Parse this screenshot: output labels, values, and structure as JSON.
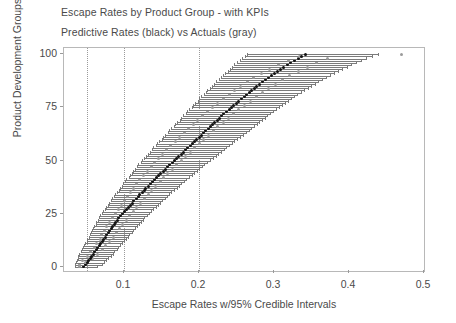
{
  "chart_data": {
    "type": "scatter",
    "title": "Escape Rates by Product Group - with KPIs",
    "subtitle": "Predictive Rates (black) vs Actuals (gray)",
    "xlabel": "Escape Rates w/95% Credible Intervals",
    "ylabel": "Product Development Groups",
    "xlim": [
      0.02,
      0.5
    ],
    "ylim": [
      -2,
      103
    ],
    "xticks": [
      0.1,
      0.2,
      0.3,
      0.4,
      0.5
    ],
    "xtick_labels": [
      "0.1",
      "0.2",
      "0.3",
      "0.4",
      "0.5"
    ],
    "yticks": [
      0,
      25,
      50,
      75,
      100
    ],
    "ytick_labels": [
      "0",
      "25",
      "50",
      "75",
      "100"
    ],
    "grid": false,
    "reference_lines": [
      0.05,
      0.1,
      0.2
    ],
    "legend": "none",
    "series": [
      {
        "name": "Predictive Rates (black)",
        "color": "#101010",
        "marker": "point"
      },
      {
        "name": "Actuals (gray)",
        "color": "#9b9b9b",
        "marker": "point"
      },
      {
        "name": "95% Credible Intervals",
        "color": "#7b7b7b",
        "marker": "hline"
      }
    ],
    "groups": [
      {
        "y": 0,
        "pred": 0.046,
        "lo": 0.034,
        "hi": 0.064,
        "actual": 0.04
      },
      {
        "y": 1,
        "pred": 0.049,
        "lo": 0.035,
        "hi": 0.07,
        "actual": 0.041
      },
      {
        "y": 2,
        "pred": 0.051,
        "lo": 0.036,
        "hi": 0.073,
        "actual": 0.049
      },
      {
        "y": 3,
        "pred": 0.053,
        "lo": 0.037,
        "hi": 0.076,
        "actual": 0.044
      },
      {
        "y": 4,
        "pred": 0.055,
        "lo": 0.038,
        "hi": 0.079,
        "actual": 0.058
      },
      {
        "y": 5,
        "pred": 0.057,
        "lo": 0.039,
        "hi": 0.082,
        "actual": 0.051
      },
      {
        "y": 6,
        "pred": 0.059,
        "lo": 0.04,
        "hi": 0.085,
        "actual": 0.064
      },
      {
        "y": 7,
        "pred": 0.061,
        "lo": 0.042,
        "hi": 0.087,
        "actual": 0.055
      },
      {
        "y": 8,
        "pred": 0.063,
        "lo": 0.044,
        "hi": 0.09,
        "actual": 0.071
      },
      {
        "y": 9,
        "pred": 0.065,
        "lo": 0.045,
        "hi": 0.092,
        "actual": 0.06
      },
      {
        "y": 10,
        "pred": 0.067,
        "lo": 0.047,
        "hi": 0.095,
        "actual": 0.075
      },
      {
        "y": 11,
        "pred": 0.069,
        "lo": 0.048,
        "hi": 0.097,
        "actual": 0.063
      },
      {
        "y": 12,
        "pred": 0.071,
        "lo": 0.05,
        "hi": 0.1,
        "actual": 0.081
      },
      {
        "y": 13,
        "pred": 0.073,
        "lo": 0.051,
        "hi": 0.102,
        "actual": 0.068
      },
      {
        "y": 14,
        "pred": 0.075,
        "lo": 0.053,
        "hi": 0.105,
        "actual": 0.086
      },
      {
        "y": 15,
        "pred": 0.077,
        "lo": 0.054,
        "hi": 0.107,
        "actual": 0.07
      },
      {
        "y": 16,
        "pred": 0.079,
        "lo": 0.056,
        "hi": 0.11,
        "actual": 0.09
      },
      {
        "y": 17,
        "pred": 0.081,
        "lo": 0.057,
        "hi": 0.112,
        "actual": 0.074
      },
      {
        "y": 18,
        "pred": 0.083,
        "lo": 0.059,
        "hi": 0.115,
        "actual": 0.094
      },
      {
        "y": 19,
        "pred": 0.085,
        "lo": 0.06,
        "hi": 0.117,
        "actual": 0.077
      },
      {
        "y": 20,
        "pred": 0.087,
        "lo": 0.062,
        "hi": 0.12,
        "actual": 0.098
      },
      {
        "y": 21,
        "pred": 0.089,
        "lo": 0.063,
        "hi": 0.122,
        "actual": 0.081
      },
      {
        "y": 22,
        "pred": 0.091,
        "lo": 0.065,
        "hi": 0.125,
        "actual": 0.103
      },
      {
        "y": 23,
        "pred": 0.093,
        "lo": 0.066,
        "hi": 0.127,
        "actual": 0.085
      },
      {
        "y": 24,
        "pred": 0.095,
        "lo": 0.068,
        "hi": 0.13,
        "actual": 0.107
      },
      {
        "y": 25,
        "pred": 0.098,
        "lo": 0.07,
        "hi": 0.133,
        "actual": 0.088
      },
      {
        "y": 26,
        "pred": 0.1,
        "lo": 0.072,
        "hi": 0.136,
        "actual": 0.112
      },
      {
        "y": 27,
        "pred": 0.103,
        "lo": 0.074,
        "hi": 0.139,
        "actual": 0.092
      },
      {
        "y": 28,
        "pred": 0.106,
        "lo": 0.076,
        "hi": 0.142,
        "actual": 0.117
      },
      {
        "y": 29,
        "pred": 0.108,
        "lo": 0.078,
        "hi": 0.145,
        "actual": 0.096
      },
      {
        "y": 30,
        "pred": 0.111,
        "lo": 0.08,
        "hi": 0.148,
        "actual": 0.122
      },
      {
        "y": 31,
        "pred": 0.113,
        "lo": 0.082,
        "hi": 0.151,
        "actual": 0.1
      },
      {
        "y": 32,
        "pred": 0.116,
        "lo": 0.084,
        "hi": 0.154,
        "actual": 0.127
      },
      {
        "y": 33,
        "pred": 0.119,
        "lo": 0.086,
        "hi": 0.157,
        "actual": 0.104
      },
      {
        "y": 34,
        "pred": 0.121,
        "lo": 0.088,
        "hi": 0.16,
        "actual": 0.132
      },
      {
        "y": 35,
        "pred": 0.124,
        "lo": 0.09,
        "hi": 0.163,
        "actual": 0.108
      },
      {
        "y": 36,
        "pred": 0.127,
        "lo": 0.093,
        "hi": 0.167,
        "actual": 0.137
      },
      {
        "y": 37,
        "pred": 0.129,
        "lo": 0.095,
        "hi": 0.17,
        "actual": 0.112
      },
      {
        "y": 38,
        "pred": 0.132,
        "lo": 0.097,
        "hi": 0.173,
        "actual": 0.142
      },
      {
        "y": 39,
        "pred": 0.135,
        "lo": 0.099,
        "hi": 0.176,
        "actual": 0.117
      },
      {
        "y": 40,
        "pred": 0.138,
        "lo": 0.101,
        "hi": 0.18,
        "actual": 0.148
      },
      {
        "y": 41,
        "pred": 0.14,
        "lo": 0.103,
        "hi": 0.183,
        "actual": 0.121
      },
      {
        "y": 42,
        "pred": 0.143,
        "lo": 0.106,
        "hi": 0.186,
        "actual": 0.153
      },
      {
        "y": 43,
        "pred": 0.146,
        "lo": 0.108,
        "hi": 0.19,
        "actual": 0.126
      },
      {
        "y": 44,
        "pred": 0.149,
        "lo": 0.11,
        "hi": 0.193,
        "actual": 0.158
      },
      {
        "y": 45,
        "pred": 0.152,
        "lo": 0.112,
        "hi": 0.197,
        "actual": 0.131
      },
      {
        "y": 46,
        "pred": 0.155,
        "lo": 0.115,
        "hi": 0.2,
        "actual": 0.164
      },
      {
        "y": 47,
        "pred": 0.158,
        "lo": 0.117,
        "hi": 0.204,
        "actual": 0.136
      },
      {
        "y": 48,
        "pred": 0.161,
        "lo": 0.119,
        "hi": 0.207,
        "actual": 0.17
      },
      {
        "y": 49,
        "pred": 0.164,
        "lo": 0.122,
        "hi": 0.211,
        "actual": 0.141
      },
      {
        "y": 50,
        "pred": 0.167,
        "lo": 0.124,
        "hi": 0.214,
        "actual": 0.176
      },
      {
        "y": 51,
        "pred": 0.17,
        "lo": 0.127,
        "hi": 0.218,
        "actual": 0.146
      },
      {
        "y": 52,
        "pred": 0.173,
        "lo": 0.129,
        "hi": 0.222,
        "actual": 0.182
      },
      {
        "y": 53,
        "pred": 0.176,
        "lo": 0.132,
        "hi": 0.225,
        "actual": 0.151
      },
      {
        "y": 54,
        "pred": 0.179,
        "lo": 0.134,
        "hi": 0.229,
        "actual": 0.188
      },
      {
        "y": 55,
        "pred": 0.182,
        "lo": 0.137,
        "hi": 0.233,
        "actual": 0.157
      },
      {
        "y": 56,
        "pred": 0.185,
        "lo": 0.139,
        "hi": 0.236,
        "actual": 0.194
      },
      {
        "y": 57,
        "pred": 0.188,
        "lo": 0.142,
        "hi": 0.24,
        "actual": 0.162
      },
      {
        "y": 58,
        "pred": 0.191,
        "lo": 0.144,
        "hi": 0.244,
        "actual": 0.2
      },
      {
        "y": 59,
        "pred": 0.194,
        "lo": 0.147,
        "hi": 0.247,
        "actual": 0.168
      },
      {
        "y": 60,
        "pred": 0.197,
        "lo": 0.15,
        "hi": 0.251,
        "actual": 0.206
      },
      {
        "y": 61,
        "pred": 0.2,
        "lo": 0.152,
        "hi": 0.255,
        "actual": 0.174
      },
      {
        "y": 62,
        "pred": 0.203,
        "lo": 0.155,
        "hi": 0.258,
        "actual": 0.212
      },
      {
        "y": 63,
        "pred": 0.206,
        "lo": 0.158,
        "hi": 0.262,
        "actual": 0.18
      },
      {
        "y": 64,
        "pred": 0.209,
        "lo": 0.16,
        "hi": 0.266,
        "actual": 0.219
      },
      {
        "y": 65,
        "pred": 0.212,
        "lo": 0.163,
        "hi": 0.269,
        "actual": 0.186
      },
      {
        "y": 66,
        "pred": 0.215,
        "lo": 0.166,
        "hi": 0.273,
        "actual": 0.225
      },
      {
        "y": 67,
        "pred": 0.218,
        "lo": 0.168,
        "hi": 0.277,
        "actual": 0.192
      },
      {
        "y": 68,
        "pred": 0.221,
        "lo": 0.171,
        "hi": 0.28,
        "actual": 0.232
      },
      {
        "y": 69,
        "pred": 0.224,
        "lo": 0.174,
        "hi": 0.284,
        "actual": 0.198
      },
      {
        "y": 70,
        "pred": 0.227,
        "lo": 0.176,
        "hi": 0.288,
        "actual": 0.239
      },
      {
        "y": 71,
        "pred": 0.23,
        "lo": 0.179,
        "hi": 0.291,
        "actual": 0.205
      },
      {
        "y": 72,
        "pred": 0.233,
        "lo": 0.182,
        "hi": 0.295,
        "actual": 0.246
      },
      {
        "y": 73,
        "pred": 0.236,
        "lo": 0.184,
        "hi": 0.299,
        "actual": 0.211
      },
      {
        "y": 74,
        "pred": 0.24,
        "lo": 0.187,
        "hi": 0.303,
        "actual": 0.253
      },
      {
        "y": 75,
        "pred": 0.243,
        "lo": 0.19,
        "hi": 0.307,
        "actual": 0.218
      },
      {
        "y": 76,
        "pred": 0.246,
        "lo": 0.192,
        "hi": 0.311,
        "actual": 0.26
      },
      {
        "y": 77,
        "pred": 0.25,
        "lo": 0.195,
        "hi": 0.315,
        "actual": 0.225
      },
      {
        "y": 78,
        "pred": 0.253,
        "lo": 0.198,
        "hi": 0.319,
        "actual": 0.268
      },
      {
        "y": 79,
        "pred": 0.256,
        "lo": 0.2,
        "hi": 0.323,
        "actual": 0.232
      },
      {
        "y": 80,
        "pred": 0.26,
        "lo": 0.203,
        "hi": 0.327,
        "actual": 0.276
      },
      {
        "y": 81,
        "pred": 0.263,
        "lo": 0.206,
        "hi": 0.331,
        "actual": 0.24
      },
      {
        "y": 82,
        "pred": 0.267,
        "lo": 0.209,
        "hi": 0.336,
        "actual": 0.284
      },
      {
        "y": 83,
        "pred": 0.27,
        "lo": 0.211,
        "hi": 0.34,
        "actual": 0.247
      },
      {
        "y": 84,
        "pred": 0.274,
        "lo": 0.214,
        "hi": 0.345,
        "actual": 0.293
      },
      {
        "y": 85,
        "pred": 0.277,
        "lo": 0.217,
        "hi": 0.349,
        "actual": 0.255
      },
      {
        "y": 86,
        "pred": 0.281,
        "lo": 0.22,
        "hi": 0.354,
        "actual": 0.302
      },
      {
        "y": 87,
        "pred": 0.285,
        "lo": 0.223,
        "hi": 0.359,
        "actual": 0.264
      },
      {
        "y": 88,
        "pred": 0.289,
        "lo": 0.226,
        "hi": 0.364,
        "actual": 0.311
      },
      {
        "y": 89,
        "pred": 0.293,
        "lo": 0.229,
        "hi": 0.369,
        "actual": 0.273
      },
      {
        "y": 90,
        "pred": 0.297,
        "lo": 0.232,
        "hi": 0.374,
        "actual": 0.321
      },
      {
        "y": 91,
        "pred": 0.301,
        "lo": 0.235,
        "hi": 0.38,
        "actual": 0.283
      },
      {
        "y": 92,
        "pred": 0.305,
        "lo": 0.238,
        "hi": 0.385,
        "actual": 0.332
      },
      {
        "y": 93,
        "pred": 0.309,
        "lo": 0.241,
        "hi": 0.391,
        "actual": 0.294
      },
      {
        "y": 94,
        "pred": 0.313,
        "lo": 0.244,
        "hi": 0.397,
        "actual": 0.344
      },
      {
        "y": 95,
        "pred": 0.318,
        "lo": 0.247,
        "hi": 0.403,
        "actual": 0.306
      },
      {
        "y": 96,
        "pred": 0.322,
        "lo": 0.25,
        "hi": 0.409,
        "actual": 0.357
      },
      {
        "y": 97,
        "pred": 0.327,
        "lo": 0.254,
        "hi": 0.416,
        "actual": 0.319
      },
      {
        "y": 98,
        "pred": 0.332,
        "lo": 0.257,
        "hi": 0.423,
        "actual": 0.371
      },
      {
        "y": 99,
        "pred": 0.337,
        "lo": 0.261,
        "hi": 0.43,
        "actual": 0.334
      },
      {
        "y": 100,
        "pred": 0.342,
        "lo": 0.264,
        "hi": 0.438,
        "actual": 0.47
      }
    ]
  },
  "colors": {
    "predictive": "#101010",
    "actual": "#9b9b9b",
    "interval": "#7b7b7b",
    "frame": "#b8b8b8",
    "text": "#4a4a4a",
    "gridline": "#9a9a9a"
  }
}
